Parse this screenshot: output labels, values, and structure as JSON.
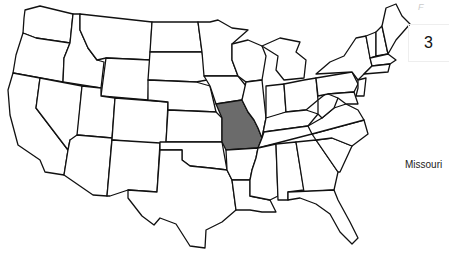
{
  "map": {
    "title": "United States",
    "highlighted_state": "Missouri",
    "highlight_color": "#6b6b6b",
    "outline_color": "#111111"
  },
  "label": {
    "text": "Missouri"
  },
  "page_number": {
    "text": "3"
  },
  "corner_mark": {
    "text": "F"
  }
}
